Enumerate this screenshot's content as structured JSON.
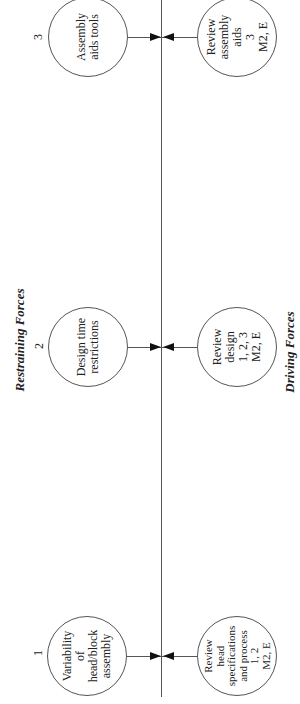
{
  "diagram": {
    "type": "force-field-analysis",
    "labels": {
      "restraining": "Restraining Forces",
      "driving": "Driving Forces"
    },
    "restraining_forces": [
      {
        "number": "1",
        "text": "Variability\nof\nhead/block\nassembly"
      },
      {
        "number": "2",
        "text": "Design time\nrestrictions"
      },
      {
        "number": "3",
        "text": "Assembly\naids tools"
      }
    ],
    "driving_forces": [
      {
        "text": "Review\nhead\nspecifications\nand process\n1, 2\nM2, E"
      },
      {
        "text": "Review\ndesign\n1, 2, 3\nM2, E"
      },
      {
        "text": "Review\nassembly\naids\n3\nM2, E"
      }
    ],
    "colors": {
      "line": "#555555",
      "arrowhead": "#111111",
      "background": "#ffffff"
    }
  }
}
